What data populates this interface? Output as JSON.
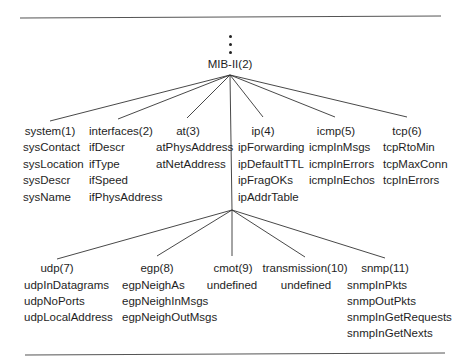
{
  "root": {
    "label": "MIB-II(2)",
    "ellipsis": [
      "•",
      "•",
      "•"
    ]
  },
  "level1": [
    {
      "label": "system(1)",
      "items": [
        "sysContact",
        "sysLocation",
        "sysDescr",
        "sysName"
      ]
    },
    {
      "label": "interfaces(2)",
      "items": [
        "ifDescr",
        "ifType",
        "ifSpeed",
        "ifPhysAddress"
      ]
    },
    {
      "label": "at(3)",
      "items": [
        "atPhysAddress",
        "atNetAddress"
      ]
    },
    {
      "label": "ip(4)",
      "items": [
        "ipForwarding",
        "ipDefaultTTL",
        "ipFragOKs",
        "ipAddrTable"
      ]
    },
    {
      "label": "icmp(5)",
      "items": [
        "icmpInMsgs",
        "icmpInErrors",
        "icmpInEchos"
      ]
    },
    {
      "label": "tcp(6)",
      "items": [
        "tcpRtoMin",
        "tcpMaxConn",
        "tcpInErrors"
      ]
    }
  ],
  "level2": [
    {
      "label": "udp(7)",
      "items": [
        "udpInDatagrams",
        "udpNoPorts",
        "udpLocalAddress"
      ]
    },
    {
      "label": "egp(8)",
      "items": [
        "egpNeighAs",
        "egpNeighInMsgs",
        "egpNeighOutMsgs"
      ]
    },
    {
      "label": "cmot(9)",
      "items": [
        "undefined"
      ]
    },
    {
      "label": "transmission(10)",
      "items": [
        "undefined"
      ]
    },
    {
      "label": "snmp(11)",
      "items": [
        "snmpInPkts",
        "snmpOutPkts",
        "snmpInGetRequests",
        "snmpInGetNexts"
      ]
    }
  ],
  "colors": {
    "line": "#333333",
    "rule": "#555555",
    "text": "#1e1e1e"
  }
}
